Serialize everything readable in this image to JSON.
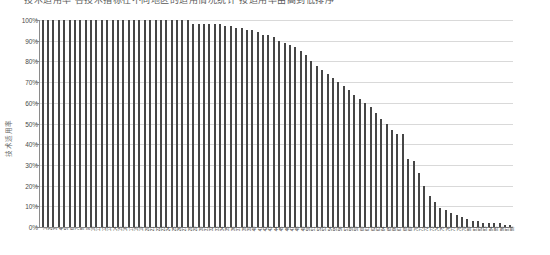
{
  "title": {
    "text": "技术适用率 各技术指标在不同地区的适用情况统计 按适用率由高到低排序",
    "clipped": true
  },
  "chart_data": {
    "type": "bar",
    "title": "",
    "xlabel": "",
    "ylabel": "技术适用率",
    "ylim": [
      0,
      100
    ],
    "ytick_labels": [
      "0%",
      "10%",
      "20%",
      "30%",
      "40%",
      "50%",
      "60%",
      "70%",
      "80%",
      "90%",
      "100%"
    ],
    "ytick_values": [
      0,
      10,
      20,
      30,
      40,
      50,
      60,
      70,
      80,
      90,
      100
    ],
    "grid": true,
    "legend": "none",
    "bar_color": "#464646",
    "gridline_color": "#d9d9d9",
    "axis_color": "#8a8a8a",
    "sorted": "descending",
    "categories": [
      "1",
      "2",
      "3",
      "4",
      "5",
      "6",
      "7",
      "8",
      "9",
      "10",
      "11",
      "12",
      "13",
      "14",
      "15",
      "16",
      "17",
      "18",
      "19",
      "20",
      "21",
      "22",
      "23",
      "24",
      "25",
      "26",
      "27",
      "28",
      "29",
      "30",
      "31",
      "32",
      "33",
      "34",
      "35",
      "36",
      "37",
      "38",
      "39",
      "40",
      "41",
      "42",
      "43",
      "44",
      "45",
      "46",
      "47",
      "48",
      "49",
      "50",
      "51",
      "52",
      "53",
      "54",
      "55",
      "56",
      "57",
      "58",
      "59",
      "60",
      "61",
      "62",
      "63",
      "64",
      "65",
      "66",
      "67",
      "68",
      "69",
      "70",
      "71",
      "72",
      "73",
      "74",
      "75",
      "76",
      "77",
      "78",
      "79",
      "80",
      "81",
      "82",
      "83",
      "84",
      "85",
      "86",
      "87",
      "88"
    ],
    "values": [
      100,
      100,
      100,
      100,
      100,
      100,
      100,
      100,
      100,
      100,
      100,
      100,
      100,
      100,
      100,
      100,
      100,
      100,
      100,
      100,
      100,
      100,
      100,
      100,
      100,
      100,
      100,
      100,
      98,
      98,
      98,
      98,
      98,
      98,
      97,
      97,
      96,
      96,
      95,
      95,
      94,
      93,
      93,
      92,
      90,
      89,
      88,
      87,
      85,
      83,
      80,
      78,
      76,
      74,
      72,
      70,
      68,
      66,
      64,
      62,
      60,
      58,
      55,
      52,
      50,
      47,
      45,
      45,
      33,
      32,
      26,
      20,
      15,
      12,
      9,
      8,
      7,
      6,
      5,
      4,
      3,
      3,
      2,
      2,
      2,
      2,
      1,
      1
    ]
  }
}
